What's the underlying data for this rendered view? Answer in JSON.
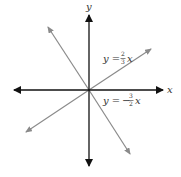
{
  "figure": {
    "axes": {
      "x_label": "x",
      "y_label": "y",
      "color": "#111111"
    },
    "lines": [
      {
        "name": "line-positive-slope",
        "equation": "y = 2/3 x",
        "label_prefix": "y =",
        "sign": "",
        "numerator": "2",
        "denominator": "3",
        "variable": "x",
        "slope": 0.6667,
        "color": "#8a8a8a"
      },
      {
        "name": "line-negative-slope",
        "equation": "y = -3/2 x",
        "label_prefix": "y =",
        "sign": "−",
        "numerator": "3",
        "denominator": "2",
        "variable": "x",
        "slope": -1.5,
        "color": "#8a8a8a"
      }
    ]
  }
}
